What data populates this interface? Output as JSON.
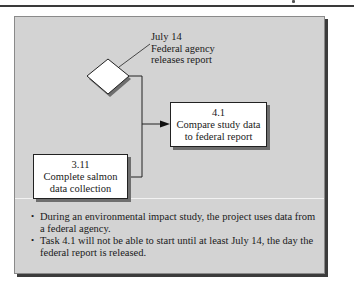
{
  "diagram": {
    "milestone": {
      "shape": "diamond",
      "date": "July 14",
      "label_line1": "Federal agency",
      "label_line2": "releases report"
    },
    "tasks": [
      {
        "id": "4.1",
        "line1": "Compare study data",
        "line2": "to federal report"
      },
      {
        "id": "3.11",
        "line1": "Complete salmon",
        "line2": "data collection"
      }
    ],
    "connections": [
      {
        "from": "milestone",
        "to": "4.1",
        "type": "arrow"
      },
      {
        "from": "3.11",
        "to": "4.1",
        "type": "arrow"
      }
    ]
  },
  "notes": [
    "During an environmental impact study, the project uses data from a federal agency.",
    "Task 4.1 will not be able to start until at least July 14, the day the federal report is released."
  ],
  "colors": {
    "panel_background": "#d3d3d3",
    "panel_shadow": "#3c3c3c",
    "box_fill": "#ffffff",
    "line": "#222222"
  }
}
